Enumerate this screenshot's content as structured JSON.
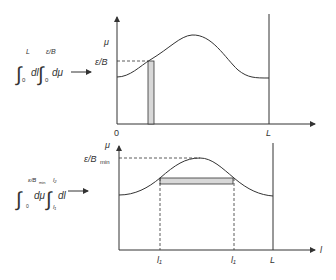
{
  "top_panel": {
    "formula": {
      "int1_upper": "L",
      "int1_lower": "0",
      "int1_var": "dl",
      "int2_upper": "ε/B",
      "int2_lower": "0",
      "int2_var": "dμ"
    },
    "y_axis_label": "μ",
    "level_label": "ε/B",
    "origin_label": "0",
    "x_end_label": "L"
  },
  "bottom_panel": {
    "formula": {
      "int1_upper": "ε/B",
      "int1_upper_sub": "min",
      "int1_lower": "0",
      "int1_var": "dμ",
      "int2_upper": "l₂",
      "int2_lower": "l₁",
      "int2_var": "dl"
    },
    "y_axis_label": "μ",
    "level_label": "ε/B",
    "level_label_sub": "min",
    "x_label_left": "l₁",
    "x_label_right": "l₁",
    "x_end_label": "L",
    "x_axis_label": "l"
  },
  "colors": {
    "line": "#333333",
    "shade": "#d8d8d8",
    "background": "#ffffff"
  }
}
